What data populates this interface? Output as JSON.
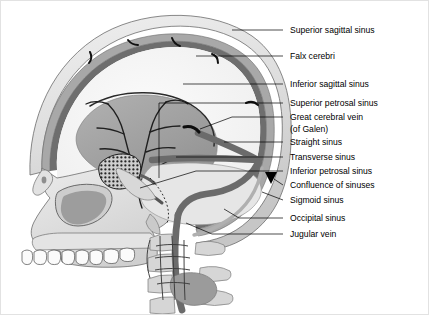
{
  "figure": {
    "background_color": "#ffffff",
    "border_color": "#e2e2e2"
  },
  "palette": {
    "ink": "#000000",
    "skull_outer": "#e8e8e8",
    "skull_mid": "#d2d2d2",
    "skull_bone": "#dcdcdc",
    "bone_shadow": "#b9b9b9",
    "dura_band": "#8c8c8c",
    "sinus_dark": "#6f6f6f",
    "falx_gray": "#a3a3a3",
    "cerebellum_gray": "#9a9a9a",
    "cavity_light": "#f2f2f2",
    "vein_black": "#1a1a1a",
    "outline": "#555555"
  },
  "labels": [
    {
      "id": "superior-sagittal-sinus",
      "text": "Superior sagittal sinus",
      "text_x": 307,
      "text_y": 33,
      "leader": "M 283 30 L 232 30"
    },
    {
      "id": "falx-cerebri",
      "text": "Falx cerebri",
      "text_x": 307,
      "text_y": 59,
      "leader": "M 283 56 L 196 56"
    },
    {
      "id": "inferior-sagittal-sinus",
      "text": "Inferior sagittal sinus",
      "text_x": 307,
      "text_y": 87,
      "leader": "M 283 84 L 183 84"
    },
    {
      "id": "superior-petrosal-sinus",
      "text": "Superior petrosal sinus",
      "text_x": 307,
      "text_y": 105,
      "leader": "M 283 103 L 159 103"
    },
    {
      "id": "great-cerebral-vein",
      "text": "Great cerebral vein",
      "text_x": 307,
      "text_y": 119,
      "leader": "M 283 117 L 235 117 L 202 128"
    },
    {
      "id": "great-cerebral-vein-line2",
      "text": "(of Galen)",
      "text_x": 307,
      "text_y": 131,
      "leader": ""
    },
    {
      "id": "straight-sinus",
      "text": "Straight sinus",
      "text_x": 307,
      "text_y": 145,
      "leader": "M 283 142 L 203 142"
    },
    {
      "id": "transverse-sinus",
      "text": "Transverse sinus",
      "text_x": 307,
      "text_y": 159,
      "leader": "M 283 157 L 160 157"
    },
    {
      "id": "inferior-petrosal-sinus",
      "text": "Inferior petrosal sinus",
      "text_x": 307,
      "text_y": 174,
      "leader": "M 283 171 L 227 171 L 160 167"
    },
    {
      "id": "confluence-of-sinuses",
      "text": "Confluence of sinuses",
      "text_x": 307,
      "text_y": 187,
      "leader": "M 283 185 L 273 179"
    },
    {
      "id": "sigmoid-sinus",
      "text": "Sigmoid sinus",
      "text_x": 307,
      "text_y": 203,
      "leader": "M 283 200 L 226 188 L 193 191"
    },
    {
      "id": "occipital-sinus",
      "text": "Occipital sinus",
      "text_x": 307,
      "text_y": 221,
      "leader": "M 283 218 L 262 212 L 250 209"
    },
    {
      "id": "jugular-vein",
      "text": "Jugular vein",
      "text_x": 307,
      "text_y": 237,
      "leader": "M 283 234 L 212 234 L 192 221"
    }
  ],
  "structures": [
    {
      "id": "skull-vault",
      "name": "Cranial vault (calvaria)"
    },
    {
      "id": "facial-skeleton",
      "name": "Facial skeleton / maxilla"
    },
    {
      "id": "upper-teeth",
      "name": "Upper teeth row",
      "count": 8
    },
    {
      "id": "nasal-cavity",
      "name": "Nasal cavity"
    },
    {
      "id": "orbit",
      "name": "Orbital opening"
    },
    {
      "id": "falx-cerebri-sheet",
      "name": "Falx cerebri (gray sheet)"
    },
    {
      "id": "cerebellum",
      "name": "Cerebellum / tentorium region"
    },
    {
      "id": "cavernous-sinus",
      "name": "Cavernous sinus (stippled plexus)"
    },
    {
      "id": "cervical-vertebrae",
      "name": "Cervical vertebrae",
      "count": 4
    },
    {
      "id": "vertebral-venous-plexus",
      "name": "Vertebral venous plexus"
    },
    {
      "id": "bridging-veins",
      "name": "Bridging veins",
      "count": 5
    },
    {
      "id": "confluence-marker",
      "name": "Confluence of sinuses marker (black triangle)"
    }
  ]
}
